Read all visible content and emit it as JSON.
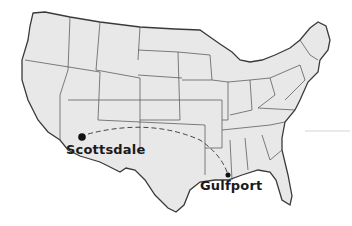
{
  "map": {
    "region": "Continental United States",
    "land_color": "#e8e8e8",
    "border_color": "#3a3a3a",
    "background": "#ffffff",
    "route_style": "dashed",
    "cities": [
      {
        "name": "Scottsdale",
        "marker": "dot"
      },
      {
        "name": "Gulfport",
        "marker": "dot"
      }
    ]
  }
}
